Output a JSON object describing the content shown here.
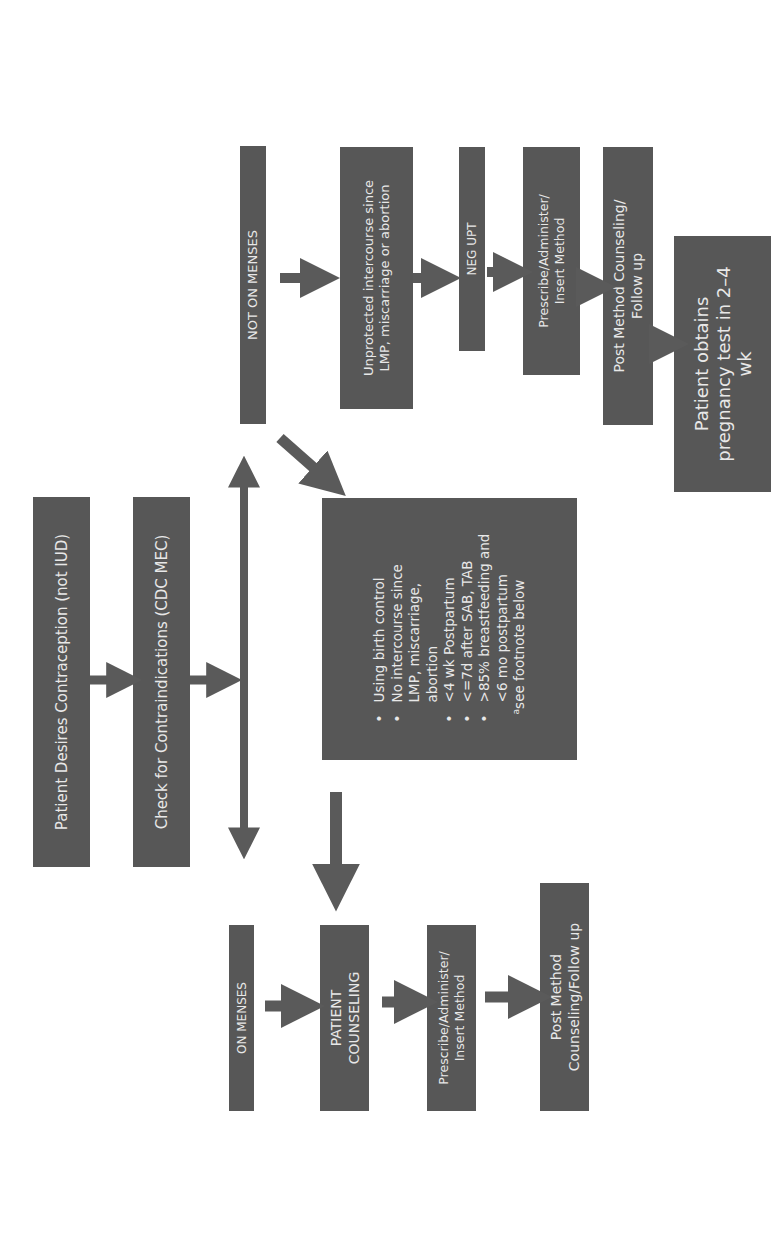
{
  "colors": {
    "box": "#575757",
    "arrow": "#5a5a5a",
    "text": "#e8e8e8",
    "background": "#ffffff"
  },
  "orientation": "rotated -90deg (text reads bottom-to-top)",
  "nodes": {
    "start": {
      "lines": [
        "Patient Desires Contraception (not IUD)"
      ]
    },
    "check": {
      "lines": [
        "Check for Contraindications (CDC MEC)"
      ]
    },
    "criteria": {
      "items": [
        {
          "type": "bullet",
          "text": "Using birth control"
        },
        {
          "type": "bullet",
          "text": "No intercourse since"
        },
        {
          "type": "cont",
          "text": "LMP, miscarriage,"
        },
        {
          "type": "cont",
          "text": "abortion"
        },
        {
          "type": "bullet",
          "text": "<4 wk Postpartum"
        },
        {
          "type": "bullet",
          "text": "<=7d after SAB, TAB"
        },
        {
          "type": "bullet",
          "text": ">85% breastfeeding and"
        },
        {
          "type": "cont",
          "text": "<6 mo postpartum"
        },
        {
          "type": "foot",
          "sup": "a",
          "text": "see footnote below"
        }
      ]
    },
    "not_on_menses": {
      "lines": [
        "NOT ON MENSES"
      ]
    },
    "unprotected": {
      "lines": [
        "Unprotected intercourse since",
        "LMP, miscarriage or abortion"
      ]
    },
    "neg_upt": {
      "lines": [
        "NEG UPT"
      ]
    },
    "prescribe_right": {
      "lines": [
        "Prescribe/Administer/",
        "Insert Method"
      ]
    },
    "post_method_right": {
      "lines": [
        "Post Method Counseling/",
        "Follow up"
      ]
    },
    "pregnancy_test": {
      "lines": [
        "Patient obtains",
        "pregnancy test in 2–4",
        "wk"
      ]
    },
    "on_menses": {
      "lines": [
        "ON MENSES"
      ]
    },
    "patient_counseling": {
      "lines": [
        "PATIENT",
        "COUNSELING"
      ]
    },
    "prescribe_left": {
      "lines": [
        "Prescribe/Administer/",
        "Insert Method"
      ]
    },
    "post_method_left": {
      "lines": [
        "Post Method",
        "Counseling/Follow up"
      ]
    }
  },
  "edges": [
    {
      "from": "start",
      "to": "check"
    },
    {
      "from": "check",
      "to": "branch"
    },
    {
      "from": "branch",
      "to": "not_on_menses",
      "bidirectional": true
    },
    {
      "from": "branch",
      "to": "on_menses",
      "bidirectional": true
    },
    {
      "from": "not_on_menses",
      "to": "unprotected"
    },
    {
      "from": "not_on_menses",
      "to": "criteria"
    },
    {
      "from": "unprotected",
      "to": "neg_upt"
    },
    {
      "from": "neg_upt",
      "to": "prescribe_right"
    },
    {
      "from": "prescribe_right",
      "to": "post_method_right"
    },
    {
      "from": "post_method_right",
      "to": "pregnancy_test"
    },
    {
      "from": "criteria",
      "to": "patient_counseling"
    },
    {
      "from": "on_menses",
      "to": "patient_counseling"
    },
    {
      "from": "patient_counseling",
      "to": "prescribe_left"
    },
    {
      "from": "prescribe_left",
      "to": "post_method_left"
    }
  ]
}
